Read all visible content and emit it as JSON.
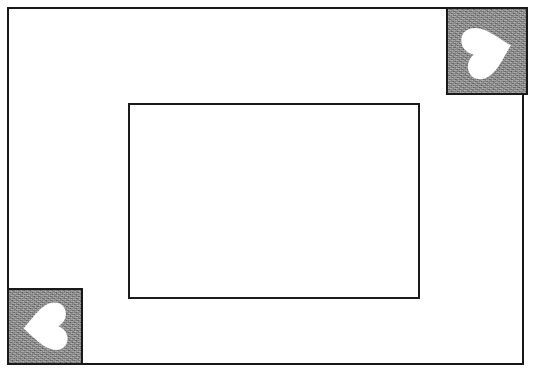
{
  "page": {
    "width": 534,
    "height": 372,
    "background_color": "#ffffff"
  },
  "caption": {
    "text": "(text cut off at top edge of image)",
    "visible_fragment": "",
    "color": "#8d8d8d"
  },
  "outer_frame": {
    "name": "outer-frame",
    "border_color": "#181818",
    "border_width_px": 2,
    "x": 7,
    "y": 7,
    "width": 517,
    "height": 358,
    "fill": "#ffffff"
  },
  "inner_rectangle": {
    "name": "inner-rectangle",
    "border_color": "#1b1b1b",
    "border_width_px": 2,
    "x": 119,
    "y": 94,
    "width": 292,
    "height": 196,
    "fill": "#ffffff"
  },
  "markers": [
    {
      "id": "top-right",
      "label": "heart-marker-top-right",
      "x": 446,
      "y": 7,
      "width": 82,
      "height": 88,
      "fill_color": "#868686",
      "border_color": "#1a1a1a",
      "shape": "heart",
      "shape_color": "#ffffff",
      "rotation_deg": -104
    },
    {
      "id": "bottom-left",
      "label": "heart-marker-bottom-left",
      "x": 7,
      "y": 288,
      "width": 76,
      "height": 77,
      "fill_color": "#868686",
      "border_color": "#1a1a1a",
      "shape": "heart",
      "shape_color": "#ffffff",
      "rotation_deg": 86
    }
  ],
  "colors": {
    "ink": "#181818",
    "gray_fill": "#868686",
    "paper": "#ffffff"
  }
}
